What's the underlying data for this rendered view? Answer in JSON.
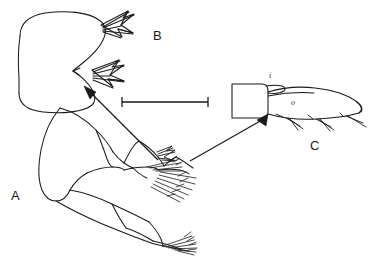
{
  "figure": {
    "type": "scientific-line-drawing",
    "background_color": "#ffffff",
    "ink_color": "#1a1a1a",
    "plate_labels": [
      {
        "key": "A",
        "text": "A",
        "x": 11,
        "y": 189,
        "describes": "segmented appendage / leg with setae"
      },
      {
        "key": "B",
        "text": "B",
        "x": 153,
        "y": 29,
        "describes": "bilobed terminal structure with two spine clusters"
      },
      {
        "key": "C",
        "text": "C",
        "x": 310,
        "y": 139,
        "describes": "elongated distal segment with marginal spines"
      }
    ],
    "part_labels": [
      {
        "key": "i",
        "text": "i",
        "x": 269,
        "y": 72,
        "describes": "inner process of segment C"
      },
      {
        "key": "o",
        "text": "o",
        "x": 291,
        "y": 99,
        "describes": "outer surface of segment C"
      }
    ],
    "scale_bar": {
      "x1": 122,
      "y1": 102,
      "x2": 208,
      "y2": 102,
      "tick_height": 9,
      "label": ""
    },
    "pointer_arrows": [
      {
        "name": "arrow-to-B",
        "from_x": 158,
        "from_y": 160,
        "to_x": 85,
        "to_y": 88,
        "describes": "detail callout from A to B"
      },
      {
        "name": "arrow-to-C",
        "from_x": 190,
        "from_y": 160,
        "to_x": 265,
        "to_y": 117,
        "describes": "detail callout from A to C"
      }
    ]
  }
}
